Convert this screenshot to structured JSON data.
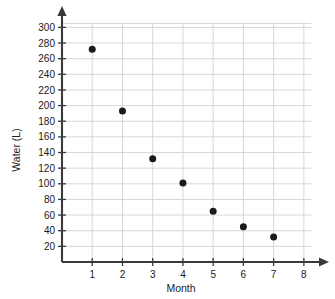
{
  "chart_data": {
    "type": "scatter",
    "title": "",
    "xlabel": "Month",
    "ylabel": "Water (L)",
    "x": [
      1,
      2,
      3,
      4,
      5,
      6,
      7
    ],
    "values": [
      272,
      193,
      132,
      101,
      65,
      45,
      32
    ],
    "points": [
      {
        "x": 1,
        "y": 272
      },
      {
        "x": 2,
        "y": 193
      },
      {
        "x": 3,
        "y": 132
      },
      {
        "x": 4,
        "y": 101
      },
      {
        "x": 5,
        "y": 65
      },
      {
        "x": 6,
        "y": 45
      },
      {
        "x": 7,
        "y": 32
      }
    ],
    "xlim": [
      0,
      8.6
    ],
    "ylim": [
      0,
      312
    ],
    "xticks": [
      1,
      2,
      3,
      4,
      5,
      6,
      7,
      8
    ],
    "xtick_labels": [
      "1",
      "2",
      "3",
      "4",
      "5",
      "6",
      "7",
      "8"
    ],
    "yticks": [
      20,
      40,
      60,
      80,
      100,
      120,
      140,
      160,
      180,
      200,
      220,
      240,
      260,
      280,
      300
    ],
    "ytick_labels": [
      "20",
      "40",
      "60",
      "80",
      "100",
      "120",
      "140",
      "160",
      "180",
      "200",
      "220",
      "240",
      "260",
      "280",
      "300"
    ],
    "grid": true,
    "legend": false,
    "marker_color": "#1a1a1a",
    "grid_color": "#d4d4d4",
    "axis_color": "#3a3a3a"
  }
}
